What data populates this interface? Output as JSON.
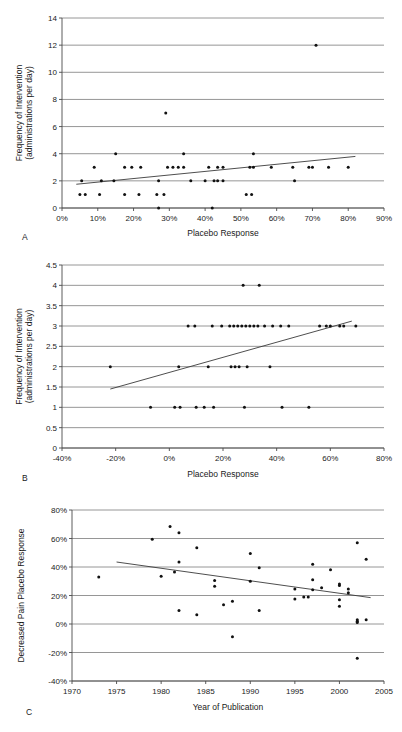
{
  "figure": {
    "type": "multi-panel-scatter",
    "panel_count": 3,
    "background": "#ffffff",
    "point_color": "#111111",
    "gridline_color": "#8a8a8a",
    "trendline_color": "#3a3a3a"
  },
  "panels": [
    {
      "letter": "A",
      "id": "panel-a"
    },
    {
      "letter": "B",
      "id": "panel-b"
    },
    {
      "letter": "C",
      "id": "panel-c"
    }
  ],
  "chart_data": [
    {
      "type": "scatter",
      "panel": "A",
      "title": "",
      "xlabel": "Placebo Response",
      "ylabel": "Frequency of Intervention (administrations per day)",
      "ylabel_line1": "Frequency of Intervention",
      "ylabel_line2": "(administrations per day)",
      "xlim": [
        0,
        90
      ],
      "ylim": [
        0,
        14
      ],
      "xticks": [
        0,
        10,
        20,
        30,
        40,
        50,
        60,
        70,
        80,
        90
      ],
      "xtick_labels": [
        "0%",
        "10%",
        "20%",
        "30%",
        "40%",
        "50%",
        "60%",
        "70%",
        "80%",
        "90%"
      ],
      "yticks": [
        0,
        2,
        4,
        6,
        8,
        10,
        12,
        14
      ],
      "ytick_labels": [
        "0",
        "2",
        "4",
        "6",
        "8",
        "10",
        "12",
        "14"
      ],
      "grid": true,
      "x_unit": "percent",
      "points": [
        [
          5.5,
          2
        ],
        [
          5.0,
          1
        ],
        [
          6.5,
          1
        ],
        [
          9.0,
          3
        ],
        [
          10.5,
          1
        ],
        [
          11.0,
          2
        ],
        [
          14.5,
          2
        ],
        [
          15.0,
          4
        ],
        [
          17.5,
          3
        ],
        [
          17.5,
          1
        ],
        [
          19.5,
          3
        ],
        [
          21.5,
          1
        ],
        [
          22.0,
          3
        ],
        [
          26.5,
          1
        ],
        [
          27.0,
          2
        ],
        [
          27.0,
          0
        ],
        [
          28.5,
          1
        ],
        [
          29.0,
          7
        ],
        [
          29.5,
          3
        ],
        [
          31.0,
          3
        ],
        [
          32.5,
          3
        ],
        [
          34.0,
          3
        ],
        [
          34.0,
          4
        ],
        [
          36.0,
          2
        ],
        [
          40.0,
          2
        ],
        [
          41.0,
          3
        ],
        [
          42.0,
          0
        ],
        [
          42.5,
          2
        ],
        [
          43.5,
          2
        ],
        [
          43.5,
          3
        ],
        [
          45.0,
          3
        ],
        [
          45.0,
          2
        ],
        [
          51.5,
          1
        ],
        [
          53.0,
          1
        ],
        [
          52.5,
          3
        ],
        [
          53.5,
          3
        ],
        [
          53.5,
          4
        ],
        [
          58.5,
          3
        ],
        [
          64.5,
          3
        ],
        [
          65.0,
          2
        ],
        [
          69.0,
          3
        ],
        [
          70.0,
          3
        ],
        [
          71.0,
          12
        ],
        [
          74.5,
          3
        ],
        [
          80.0,
          3
        ]
      ],
      "trendline": {
        "x1": 4.0,
        "y1": 1.75,
        "x2": 82.0,
        "y2": 3.8
      }
    },
    {
      "type": "scatter",
      "panel": "B",
      "title": "",
      "xlabel": "Placebo Response",
      "ylabel": "Frequency of Intervention (administrations per day)",
      "ylabel_line1": "Frequency of Intervention",
      "ylabel_line2": "(administrations per day)",
      "xlim": [
        -40,
        80
      ],
      "ylim": [
        0,
        4.5
      ],
      "xticks": [
        -40,
        -20,
        0,
        20,
        40,
        60,
        80
      ],
      "xtick_labels": [
        "-40%",
        "-20%",
        "0%",
        "20%",
        "40%",
        "60%",
        "80%"
      ],
      "yticks": [
        0,
        0.5,
        1,
        1.5,
        2,
        2.5,
        3,
        3.5,
        4,
        4.5
      ],
      "ytick_labels": [
        "0",
        "0.5",
        "1",
        "1.5",
        "2",
        "2.5",
        "3",
        "3.5",
        "4",
        "4.5"
      ],
      "grid": true,
      "x_unit": "percent",
      "points": [
        [
          -22.0,
          2
        ],
        [
          -7.0,
          1
        ],
        [
          3.5,
          2
        ],
        [
          2.0,
          1
        ],
        [
          4.0,
          1
        ],
        [
          7.0,
          3
        ],
        [
          9.5,
          3
        ],
        [
          10.0,
          1
        ],
        [
          13.0,
          1
        ],
        [
          16.5,
          1
        ],
        [
          14.5,
          2
        ],
        [
          16.0,
          3
        ],
        [
          19.5,
          3
        ],
        [
          22.5,
          3
        ],
        [
          24.0,
          3
        ],
        [
          25.5,
          3
        ],
        [
          23.0,
          2
        ],
        [
          24.5,
          2
        ],
        [
          26.0,
          2
        ],
        [
          27.5,
          4
        ],
        [
          27.0,
          3
        ],
        [
          28.5,
          3
        ],
        [
          29.0,
          2
        ],
        [
          30.0,
          3
        ],
        [
          31.5,
          3
        ],
        [
          28.0,
          1
        ],
        [
          33.5,
          4
        ],
        [
          33.0,
          3
        ],
        [
          35.5,
          3
        ],
        [
          37.5,
          2
        ],
        [
          38.5,
          3
        ],
        [
          41.5,
          3
        ],
        [
          42.0,
          1
        ],
        [
          44.5,
          3
        ],
        [
          52.0,
          1
        ],
        [
          56.0,
          3
        ],
        [
          58.5,
          3
        ],
        [
          60.0,
          3
        ],
        [
          63.5,
          3
        ],
        [
          65.0,
          3
        ],
        [
          69.5,
          3
        ]
      ],
      "trendline": {
        "x1": -22.0,
        "y1": 1.45,
        "x2": 68.0,
        "y2": 3.12
      }
    },
    {
      "type": "scatter",
      "panel": "C",
      "title": "",
      "xlabel": "Year of Publication",
      "ylabel": "Decreased Pain Placebo Response",
      "xlim": [
        1970,
        2005
      ],
      "ylim": [
        -40,
        80
      ],
      "xticks": [
        1970,
        1975,
        1980,
        1985,
        1990,
        1995,
        2000,
        2005
      ],
      "xtick_labels": [
        "1970",
        "1975",
        "1980",
        "1985",
        "1990",
        "1995",
        "2000",
        "2005"
      ],
      "yticks": [
        -40,
        -20,
        0,
        20,
        40,
        60,
        80
      ],
      "ytick_labels": [
        "-40%",
        "-20%",
        "0%",
        "20%",
        "40%",
        "60%",
        "80%"
      ],
      "grid": true,
      "y_unit": "percent",
      "points": [
        [
          1973,
          33
        ],
        [
          1979,
          59.5
        ],
        [
          1980,
          33.5
        ],
        [
          1981,
          68.5
        ],
        [
          1981.5,
          36.5
        ],
        [
          1982,
          64
        ],
        [
          1982,
          43.5
        ],
        [
          1982,
          9.5
        ],
        [
          1984,
          53.5
        ],
        [
          1984,
          6.5
        ],
        [
          1986,
          30.5
        ],
        [
          1986,
          26.5
        ],
        [
          1987,
          13.5
        ],
        [
          1988,
          16
        ],
        [
          1988,
          -9
        ],
        [
          1990,
          49.5
        ],
        [
          1990,
          30
        ],
        [
          1991,
          39.5
        ],
        [
          1991,
          9.5
        ],
        [
          1995,
          24.5
        ],
        [
          1995,
          17.5
        ],
        [
          1996,
          19
        ],
        [
          1996.5,
          19
        ],
        [
          1997,
          42
        ],
        [
          1997,
          31
        ],
        [
          1997,
          24
        ],
        [
          1998,
          25.5
        ],
        [
          1999,
          38
        ],
        [
          2000,
          28
        ],
        [
          2000,
          27
        ],
        [
          2000,
          17
        ],
        [
          2000,
          12.5
        ],
        [
          2001,
          24.5
        ],
        [
          2001,
          22
        ],
        [
          2002,
          57
        ],
        [
          2002,
          3
        ],
        [
          2002,
          2
        ],
        [
          2002,
          1
        ],
        [
          2002,
          -24
        ],
        [
          2003,
          45.5
        ],
        [
          2003,
          3
        ]
      ],
      "trendline": {
        "x1": 1975.0,
        "y1": 43.5,
        "x2": 2003.5,
        "y2": 18.5
      }
    }
  ]
}
